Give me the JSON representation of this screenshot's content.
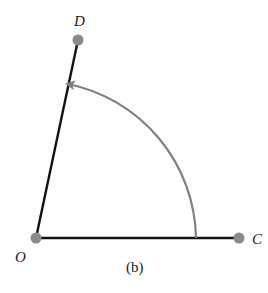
{
  "figure": {
    "caption": "(b)",
    "points": {
      "O": {
        "label": "O",
        "x": 36,
        "y": 238
      },
      "C": {
        "label": "C",
        "x": 239,
        "y": 238
      },
      "D": {
        "label": "D",
        "x": 78,
        "y": 40
      }
    },
    "segments": [
      {
        "from": "O",
        "to": "C",
        "color": "#111111"
      },
      {
        "from": "O",
        "to": "D",
        "color": "#111111"
      }
    ],
    "arc": {
      "center": "O",
      "radius": 160,
      "from_ray": "OC",
      "to_ray": "OD",
      "direction": "counterclockwise",
      "arrowhead": "end",
      "color": "#808080"
    },
    "colors": {
      "point_fill": "#8a8a8a",
      "line": "#111111",
      "arc": "#808080"
    }
  }
}
